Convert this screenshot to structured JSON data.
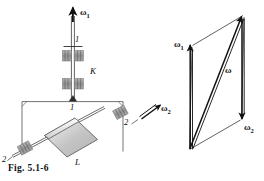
{
  "figure": {
    "caption": "Fig. 5.1-6",
    "domain_kind": "mechanics-diagram"
  },
  "colors": {
    "ink": "#111111",
    "line": "#3a3a3a",
    "bearing_fill": "#9a9a9a",
    "block_light": "#efefef",
    "block_mid": "#c9c9c9",
    "block_dark": "#b0b0b0",
    "background": "#ffffff"
  },
  "mechanism": {
    "name": "gyroscope-mechanism",
    "axis_1_label": "1",
    "axis_1_label_lower": "1",
    "axis_2_label_left": "2",
    "axis_2_label_right": "2",
    "housing_label": "K",
    "body_label": "L",
    "omega_1_label": "ω",
    "omega_1_sub": "1",
    "omega_2_label": "ω",
    "omega_2_sub": "2"
  },
  "vector_diagram": {
    "name": "angular-velocity-parallelogram",
    "omega_1_label": "ω",
    "omega_1_sub": "1",
    "omega_2_label": "ω",
    "omega_2_sub": "2",
    "omega_resultant_label": "ω",
    "omega_resultant_sub": ""
  }
}
